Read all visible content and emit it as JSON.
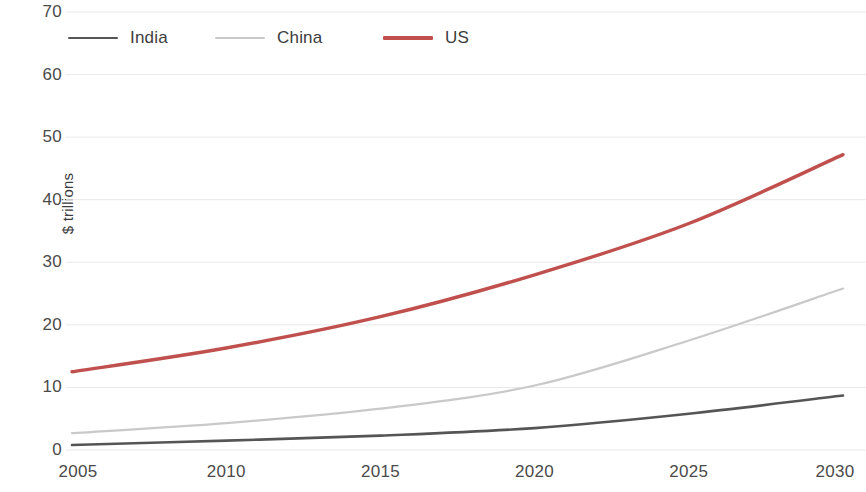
{
  "chart_data": {
    "type": "line",
    "title": "",
    "xlabel": "",
    "ylabel": "$ trillions",
    "x": [
      2005,
      2010,
      2015,
      2020,
      2025,
      2030
    ],
    "xlim": [
      2005,
      2030
    ],
    "ylim": [
      0,
      70
    ],
    "yticks": [
      0,
      10,
      20,
      30,
      40,
      50,
      60,
      70
    ],
    "xticks": [
      2005,
      2010,
      2015,
      2020,
      2025,
      2030
    ],
    "grid": true,
    "legend_position": "top-left",
    "series": [
      {
        "name": "India",
        "color": "#555555",
        "x": [
          2005,
          2010,
          2015,
          2020,
          2025,
          2030
        ],
        "values": [
          0.8,
          1.5,
          2.3,
          3.5,
          5.8,
          8.7
        ]
      },
      {
        "name": "China",
        "color": "#c9c9c9",
        "x": [
          2005,
          2010,
          2015,
          2020,
          2025,
          2030
        ],
        "values": [
          2.7,
          4.3,
          6.6,
          10.3,
          17.5,
          25.8
        ]
      },
      {
        "name": "US",
        "color": "#c0504d",
        "x": [
          2005,
          2010,
          2015,
          2020,
          2025,
          2030
        ],
        "values": [
          12.5,
          16.3,
          21.3,
          28.0,
          36.2,
          47.2
        ]
      }
    ]
  },
  "axis": {
    "y_title": "$ trillions",
    "y_ticks": [
      "0",
      "10",
      "20",
      "30",
      "40",
      "50",
      "60",
      "70"
    ],
    "x_ticks": [
      "2005",
      "2010",
      "2015",
      "2020",
      "2025",
      "2030"
    ]
  },
  "legend": {
    "items": [
      {
        "label": "India",
        "color": "#555555"
      },
      {
        "label": "China",
        "color": "#c9c9c9"
      },
      {
        "label": "US",
        "color": "#c0504d"
      }
    ]
  }
}
